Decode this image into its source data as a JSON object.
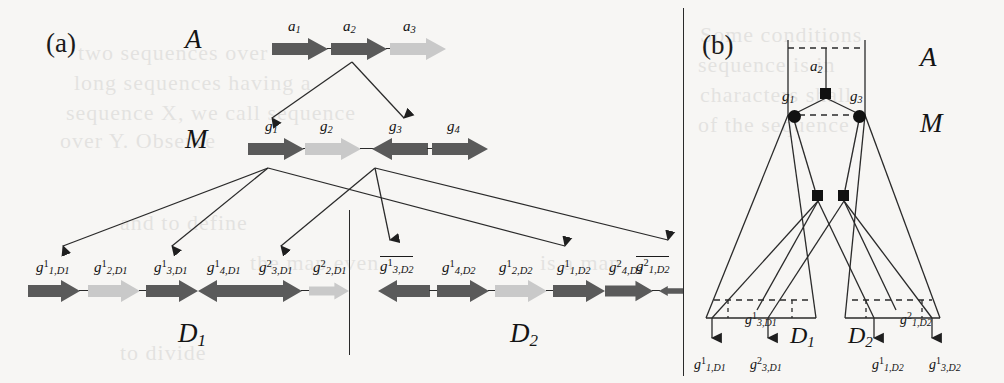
{
  "figure": {
    "panel_a_label": "(a)",
    "panel_b_label": "(b)",
    "colors": {
      "gene_dark": "#5a5a5a",
      "gene_light": "#c9c9c9",
      "line": "#2a2a2a",
      "text": "#121212",
      "background": "#f7f6f4"
    }
  },
  "panel_a": {
    "rows": [
      {
        "name": "A",
        "label": "A",
        "genes": [
          {
            "label": "a",
            "sub": "1",
            "dir": "right",
            "shade": "dark"
          },
          {
            "label": "a",
            "sub": "2",
            "dir": "right",
            "shade": "dark"
          },
          {
            "label": "a",
            "sub": "3",
            "dir": "right",
            "shade": "light"
          }
        ]
      },
      {
        "name": "M",
        "label": "M",
        "genes": [
          {
            "label": "g",
            "sub": "1",
            "dir": "right",
            "shade": "dark"
          },
          {
            "label": "g",
            "sub": "2",
            "dir": "right",
            "shade": "light"
          },
          {
            "label": "g",
            "sub": "3",
            "dir": "left",
            "shade": "dark"
          },
          {
            "label": "g",
            "sub": "4",
            "dir": "right",
            "shade": "dark"
          }
        ]
      }
    ],
    "descendants": [
      {
        "name": "D1",
        "label": "D",
        "label_sub": "1",
        "genes": [
          {
            "label": "g",
            "sup": "1",
            "sub": "1,D",
            "subsub": "1",
            "dir": "right",
            "shade": "dark",
            "bar": false
          },
          {
            "label": "g",
            "sup": "1",
            "sub": "2,D",
            "subsub": "1",
            "dir": "right",
            "shade": "light",
            "bar": false
          },
          {
            "label": "g",
            "sup": "1",
            "sub": "3,D",
            "subsub": "1",
            "dir": "right",
            "shade": "dark",
            "bar": false
          },
          {
            "label": "g",
            "sup": "1",
            "sub": "4,D",
            "subsub": "1",
            "dir": "left",
            "shade": "dark",
            "bar": false
          },
          {
            "label": "g",
            "sup": "2",
            "sub": "3,D",
            "subsub": "1",
            "dir": "right",
            "shade": "dark",
            "bar": false
          },
          {
            "label": "g",
            "sup": "2",
            "sub": "2,D",
            "subsub": "1",
            "dir": "right",
            "shade": "light",
            "bar": false
          }
        ]
      },
      {
        "name": "D2",
        "label": "D",
        "label_sub": "2",
        "genes": [
          {
            "label": "g",
            "sup": "1",
            "sub": "3,D",
            "subsub": "2",
            "dir": "left",
            "shade": "dark",
            "bar": true
          },
          {
            "label": "g",
            "sup": "1",
            "sub": "4,D",
            "subsub": "2",
            "dir": "right",
            "shade": "dark",
            "bar": false
          },
          {
            "label": "g",
            "sup": "1",
            "sub": "2,D",
            "subsub": "2",
            "dir": "right",
            "shade": "light",
            "bar": false
          },
          {
            "label": "g",
            "sup": "1",
            "sub": "1,D",
            "subsub": "2",
            "dir": "right",
            "shade": "dark",
            "bar": false
          },
          {
            "label": "g",
            "sup": "2",
            "sub": "4,D",
            "subsub": "2",
            "dir": "right",
            "shade": "dark",
            "bar": false
          },
          {
            "label": "g",
            "sup": "2",
            "sub": "1,D",
            "subsub": "2",
            "dir": "left",
            "shade": "dark",
            "bar": true
          }
        ]
      }
    ]
  },
  "panel_b": {
    "region_labels": {
      "A": "A",
      "M": "M",
      "D1": "D",
      "D1_sub": "1",
      "D2": "D",
      "D2_sub": "2"
    },
    "top_node_label": "a",
    "top_node_sub": "2",
    "m_nodes": [
      {
        "label": "g",
        "sub": "1"
      },
      {
        "label": "g",
        "sub": "3"
      }
    ],
    "inner_labels": [
      {
        "label": "g",
        "sup": "1",
        "sub": "3,D",
        "subsub": "1"
      },
      {
        "label": "g",
        "sup": "2",
        "sub": "1,D",
        "subsub": "2"
      }
    ],
    "leaf_labels": [
      {
        "label": "g",
        "sup": "1",
        "sub": "1,D",
        "subsub": "1"
      },
      {
        "label": "g",
        "sup": "2",
        "sub": "3,D",
        "subsub": "1"
      },
      {
        "label": "g",
        "sup": "1",
        "sub": "1,D",
        "subsub": "2"
      },
      {
        "label": "g",
        "sup": "1",
        "sub": "3,D",
        "subsub": "2"
      }
    ]
  },
  "bleed_text": [
    "two sequences over",
    "long sequences having a",
    "sequence X, we call sequence",
    "over Y. Observe",
    "sequences of X to the",
    "The map even",
    "is a map",
    "to divide"
  ]
}
